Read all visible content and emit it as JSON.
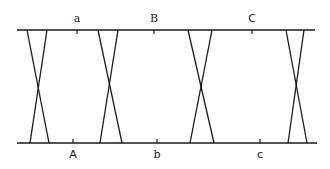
{
  "diagram": {
    "stroke_color": "#1a1a1a",
    "background": "#ffffff",
    "top_line": {
      "x1": 17,
      "x2": 315,
      "y": 30
    },
    "bottom_line": {
      "x1": 17,
      "x2": 317,
      "y": 143
    },
    "top_labels": [
      {
        "text": "a",
        "x": 77
      },
      {
        "text": "B",
        "x": 154
      },
      {
        "text": "C",
        "x": 252
      }
    ],
    "bottom_labels": [
      {
        "text": "A",
        "x": 73
      },
      {
        "text": "b",
        "x": 157
      },
      {
        "text": "c",
        "x": 260
      }
    ],
    "crossings": [
      {
        "top_left": 27,
        "top_right": 47,
        "bottom_left": 30,
        "bottom_right": 49
      },
      {
        "top_left": 98,
        "top_right": 118,
        "bottom_left": 100,
        "bottom_right": 122
      },
      {
        "top_left": 188,
        "top_right": 212,
        "bottom_left": 190,
        "bottom_right": 214
      },
      {
        "top_left": 286,
        "top_right": 304,
        "bottom_left": 288,
        "bottom_right": 307
      }
    ]
  }
}
